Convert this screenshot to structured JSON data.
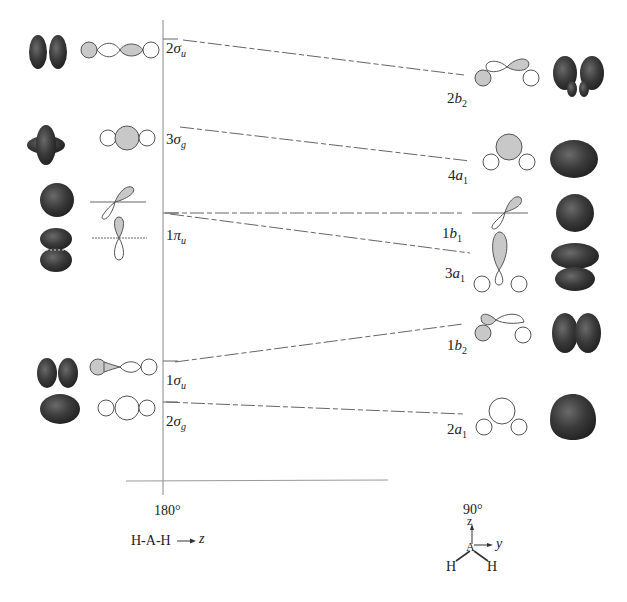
{
  "diagram": {
    "type": "walsh-correlation-diagram",
    "left_geometry": {
      "angle_label": "180°",
      "molecule_label": "H-A-H",
      "axis_label": "z"
    },
    "right_geometry": {
      "angle_label": "90°",
      "axis_z": "z",
      "axis_y": "y",
      "center_atom": "A",
      "h_left": "H",
      "h_right": "H"
    },
    "colors": {
      "line": "#666666",
      "axis": "#888888",
      "lobe_fill": "#c8c8c8",
      "surface_dark": "#3a3a3a"
    },
    "levels": [
      {
        "left": {
          "num": "2",
          "sym": "σ",
          "sub": "u"
        },
        "right": {
          "num": "2",
          "sym": "b",
          "sub": "2"
        },
        "y_left": 39,
        "y_right": 75
      },
      {
        "left": {
          "num": "3",
          "sym": "σ",
          "sub": "g"
        },
        "right": {
          "num": "4",
          "sym": "a",
          "sub": "1"
        },
        "y_left": 127,
        "y_right": 160
      },
      {
        "left": {
          "num": "1",
          "sym": "π",
          "sub": "u"
        },
        "right": {
          "num": "1",
          "sym": "b",
          "sub": "1"
        },
        "y_left": 213,
        "y_right": 213
      },
      {
        "left": {
          "num": "1",
          "sym": "π",
          "sub": "u"
        },
        "right": {
          "num": "3",
          "sym": "a",
          "sub": "1"
        },
        "y_left": 213,
        "y_right": 253
      },
      {
        "left": {
          "num": "1",
          "sym": "σ",
          "sub": "u"
        },
        "right": {
          "num": "1",
          "sym": "b",
          "sub": "2"
        },
        "y_left": 361,
        "y_right": 324
      },
      {
        "left": {
          "num": "2",
          "sym": "σ",
          "sub": "g"
        },
        "right": {
          "num": "2",
          "sym": "a",
          "sub": "1"
        },
        "y_left": 402,
        "y_right": 414
      }
    ],
    "left_labels": [
      {
        "text_num": "2",
        "text_sym": "σ",
        "text_sub": "u",
        "x": 165,
        "y": 44
      },
      {
        "text_num": "3",
        "text_sym": "σ",
        "text_sub": "g",
        "x": 165,
        "y": 130
      },
      {
        "text_num": "1",
        "text_sym": "π",
        "text_sub": "u",
        "x": 165,
        "y": 228
      },
      {
        "text_num": "1",
        "text_sym": "σ",
        "text_sub": "u",
        "x": 165,
        "y": 372
      },
      {
        "text_num": "2",
        "text_sym": "σ",
        "text_sub": "g",
        "x": 165,
        "y": 413
      }
    ],
    "right_labels": [
      {
        "text_num": "2",
        "text_sym": "b",
        "text_sub": "2",
        "x": 447,
        "y": 91
      },
      {
        "text_num": "4",
        "text_sym": "a",
        "text_sub": "1",
        "x": 448,
        "y": 168
      },
      {
        "text_num": "1",
        "text_sym": "b",
        "text_sub": "1",
        "x": 442,
        "y": 226
      },
      {
        "text_num": "3",
        "text_sym": "a",
        "text_sub": "1",
        "x": 445,
        "y": 266
      },
      {
        "text_num": "1",
        "text_sym": "b",
        "text_sub": "2",
        "x": 447,
        "y": 338
      },
      {
        "text_num": "2",
        "text_sym": "a",
        "text_sub": "1",
        "x": 447,
        "y": 422
      }
    ]
  }
}
